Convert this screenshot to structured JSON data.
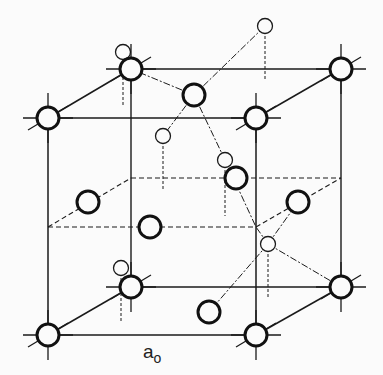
{
  "diagram": {
    "label": {
      "main": "a",
      "sub": "o",
      "x": 150,
      "y": 338
    },
    "colors": {
      "ink": "#1a1a1a",
      "background": "#fbfbfb"
    },
    "cube": {
      "front": [
        [
          48,
          118
        ],
        [
          256,
          118
        ],
        [
          256,
          335
        ],
        [
          48,
          335
        ]
      ],
      "back": [
        [
          131,
          69
        ],
        [
          341,
          69
        ],
        [
          341,
          287
        ],
        [
          131,
          287
        ]
      ]
    },
    "corner_atoms": [
      [
        48,
        118
      ],
      [
        256,
        118
      ],
      [
        256,
        335
      ],
      [
        48,
        335
      ],
      [
        131,
        69
      ],
      [
        341,
        69
      ],
      [
        341,
        287
      ],
      [
        131,
        287
      ]
    ],
    "face_center_atoms": [
      [
        194,
        95
      ],
      [
        150,
        227
      ],
      [
        88,
        202
      ],
      [
        298,
        202
      ],
      [
        236,
        178
      ],
      [
        209,
        312
      ]
    ],
    "interior_atoms": [
      [
        163,
        136
      ],
      [
        225,
        160
      ],
      [
        268,
        244
      ],
      [
        121,
        268
      ]
    ],
    "outside_atoms": [
      [
        123,
        52
      ],
      [
        265,
        26
      ]
    ]
  }
}
